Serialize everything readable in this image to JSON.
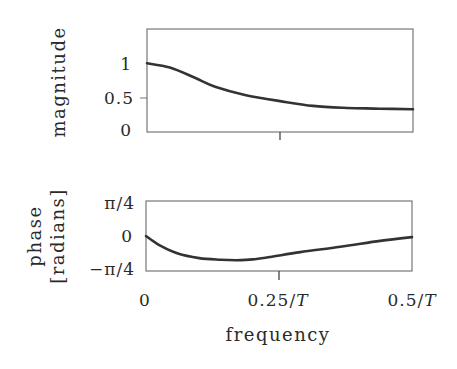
{
  "chart_data": [
    {
      "type": "line",
      "title": "",
      "xlabel": "",
      "ylabel": "magnitude",
      "xlim": [
        0,
        0.5
      ],
      "ylim": [
        0,
        1.5
      ],
      "xticks": [
        0,
        0.25,
        0.5
      ],
      "xtick_labels": [
        "",
        "",
        ""
      ],
      "yticks": [
        0,
        0.5,
        1
      ],
      "ytick_labels": [
        "0",
        "0.5",
        "1"
      ],
      "grid": false,
      "legend": null,
      "series": [
        {
          "name": "magnitude",
          "x": [
            0,
            0.043,
            0.09,
            0.128,
            0.184,
            0.25,
            0.312,
            0.376,
            0.438,
            0.5
          ],
          "y": [
            1.0,
            0.94,
            0.79,
            0.66,
            0.54,
            0.45,
            0.38,
            0.35,
            0.34,
            0.33
          ]
        }
      ]
    },
    {
      "type": "line",
      "title": "",
      "xlabel": "frequency",
      "ylabel": "phase [radians]",
      "xlim": [
        0,
        0.5
      ],
      "ylim": [
        -0.7854,
        0.7854
      ],
      "xticks": [
        0,
        0.25,
        0.5
      ],
      "xtick_labels": [
        "0",
        "0.25/T",
        "0.5/T"
      ],
      "yticks": [
        -0.7854,
        0,
        0.7854
      ],
      "ytick_labels": [
        "−π/4",
        "0",
        "π/4"
      ],
      "grid": false,
      "legend": null,
      "series": [
        {
          "name": "phase",
          "x": [
            0,
            0.025,
            0.06,
            0.1,
            0.14,
            0.17,
            0.2,
            0.233,
            0.29,
            0.365,
            0.44,
            0.5
          ],
          "y": [
            0,
            -0.204,
            -0.393,
            -0.495,
            -0.534,
            -0.542,
            -0.526,
            -0.471,
            -0.361,
            -0.243,
            -0.11,
            -0.024
          ]
        }
      ]
    }
  ],
  "labels": {
    "mag_ylabel": "magnitude",
    "phase_ylabel_line1": "phase",
    "phase_ylabel_line2": "[radians]",
    "mag_tick_1": "1",
    "mag_tick_05": "0.5",
    "mag_tick_0": "0",
    "phase_tick_top": "π/4",
    "phase_tick_mid": "0",
    "phase_tick_bot": "−π/4",
    "x_tick_0": "0",
    "x_tick_mid_num": "0.25/",
    "x_tick_end_num": "0.5/",
    "x_tick_T": "T",
    "xlabel": "frequency"
  },
  "colors": {
    "line": "#333333",
    "axes": "#777777",
    "text": "#2a2a2a",
    "background": "#ffffff"
  }
}
